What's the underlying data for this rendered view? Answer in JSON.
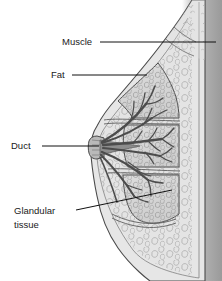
{
  "figure": {
    "background_color": "#ffffff"
  },
  "labels": [
    {
      "id": "muscle",
      "text": "Muscle",
      "line1": "Muscle",
      "line2": "",
      "text_x": 62,
      "text_y": 45,
      "anchor": "start",
      "leader": {
        "x1": 100,
        "y1": 42,
        "x2": 216,
        "y2": 42
      }
    },
    {
      "id": "fat",
      "text": "Fat",
      "line1": "Fat",
      "line2": "",
      "text_x": 51,
      "text_y": 78,
      "anchor": "start",
      "leader": {
        "x1": 72,
        "y1": 75,
        "x2": 147,
        "y2": 75
      }
    },
    {
      "id": "duct",
      "text": "Duct",
      "line1": "Duct",
      "line2": "",
      "text_x": 11,
      "text_y": 149,
      "anchor": "start",
      "leader": {
        "x1": 42,
        "y1": 146,
        "x2": 99,
        "y2": 146
      }
    },
    {
      "id": "glandular-tissue",
      "text": "Glandular tissue",
      "line1": "Glandular",
      "line2": "tissue",
      "text_x": 14,
      "text_y": 214,
      "anchor": "start",
      "leader": {
        "x1": 76,
        "y1": 210,
        "x2": 172,
        "y2": 190
      }
    }
  ],
  "colors": {
    "outline": "#4a4a4a",
    "skin_fill": "#e4e4e4",
    "fat_fill": "#dedede",
    "gland_fill": "#d6d6d6",
    "duct_dark": "#6a6a6a",
    "chest_wall": "#a8a8a8",
    "label_text": "#1a1a1a",
    "leader_line": "#111111",
    "background": "#ffffff"
  },
  "anatomy": {
    "parts": [
      {
        "name": "chest-wall",
        "description": "Vertical gray band at right edge"
      },
      {
        "name": "pectoral-muscle",
        "description": "Muscle layer along chest wall"
      },
      {
        "name": "subcutaneous-fat",
        "description": "Bubbly fat tissue under skin"
      },
      {
        "name": "glandular-lobes",
        "description": "Three lobulated glandular masses"
      },
      {
        "name": "lactiferous-ducts",
        "description": "Branching ducts converging at nipple"
      },
      {
        "name": "nipple",
        "description": "Protrusion at left of breast"
      },
      {
        "name": "skin-outline",
        "description": "Outer contour of breast"
      }
    ]
  }
}
